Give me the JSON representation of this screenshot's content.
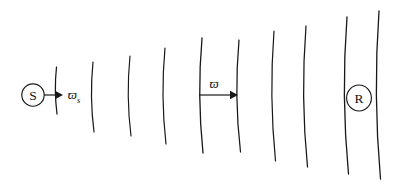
{
  "figure": {
    "type": "wave-propagation-diagram",
    "canvas": {
      "width": 401,
      "height": 190,
      "background": "#ffffff"
    },
    "stroke_color": "#181818"
  },
  "nodes": [
    {
      "id": "source",
      "label": "S",
      "name": "source-node",
      "cx": 33,
      "cy": 95,
      "r": 11.2
    },
    {
      "id": "receiver",
      "label": "R",
      "name": "receiver-node",
      "cx": 359,
      "cy": 98,
      "rx": 12.4,
      "ry": 13.0
    }
  ],
  "wavefronts": [
    {
      "index": 1,
      "x_top": 56.5,
      "x_mid": 54.0,
      "x_bot": 57.0,
      "y_top": 67,
      "y_bot": 114,
      "stroke_width": 1.25
    },
    {
      "index": 2,
      "x_top": 93.0,
      "x_mid": 89.5,
      "x_bot": 94.0,
      "y_top": 62,
      "y_bot": 132,
      "stroke_width": 1.2
    },
    {
      "index": 3,
      "x_top": 130.0,
      "x_mid": 126.0,
      "x_bot": 131.0,
      "y_top": 56,
      "y_bot": 136,
      "stroke_width": 1.15
    },
    {
      "index": 4,
      "x_top": 165.0,
      "x_mid": 160.5,
      "x_bot": 166.0,
      "y_top": 48,
      "y_bot": 144,
      "stroke_width": 1.2
    },
    {
      "index": 5,
      "x_top": 202.0,
      "x_mid": 197.0,
      "x_bot": 203.0,
      "y_top": 38,
      "y_bot": 153,
      "stroke_width": 1.3
    },
    {
      "index": 6,
      "x_top": 239.0,
      "x_mid": 234.0,
      "x_bot": 240.5,
      "y_top": 40,
      "y_bot": 152,
      "stroke_width": 1.25
    },
    {
      "index": 7,
      "x_top": 274.0,
      "x_mid": 269.0,
      "x_bot": 275.5,
      "y_top": 31,
      "y_bot": 161,
      "stroke_width": 1.2
    },
    {
      "index": 8,
      "x_top": 306.0,
      "x_mid": 300.5,
      "x_bot": 307.5,
      "y_top": 26,
      "y_bot": 167,
      "stroke_width": 1.25
    },
    {
      "index": 9,
      "x_top": 347.0,
      "x_mid": 341.0,
      "x_bot": 348.5,
      "y_top": 17,
      "y_bot": 174,
      "stroke_width": 1.3
    },
    {
      "index": 10,
      "x_top": 379.0,
      "x_mid": 373.0,
      "x_bot": 380.5,
      "y_top": 11,
      "y_bot": 179,
      "stroke_width": 1.3
    }
  ],
  "measurements": [
    {
      "id": "source-wavelength",
      "name": "source-wavelength-measure",
      "symbol": "ϖ",
      "subscript": "s",
      "line": {
        "x1": 44,
        "y1": 95,
        "x2": 58,
        "y2": 95
      },
      "arrow_tip_x": 63,
      "label_x": 74,
      "label_y": 99
    },
    {
      "id": "field-wavelength",
      "name": "field-wavelength-measure",
      "symbol": "ϖ",
      "subscript": "",
      "line": {
        "x1": 199,
        "y1": 95,
        "x2": 231,
        "y2": 95
      },
      "arrow_tip_x": 238,
      "label_x": 214,
      "label_y": 88
    }
  ]
}
